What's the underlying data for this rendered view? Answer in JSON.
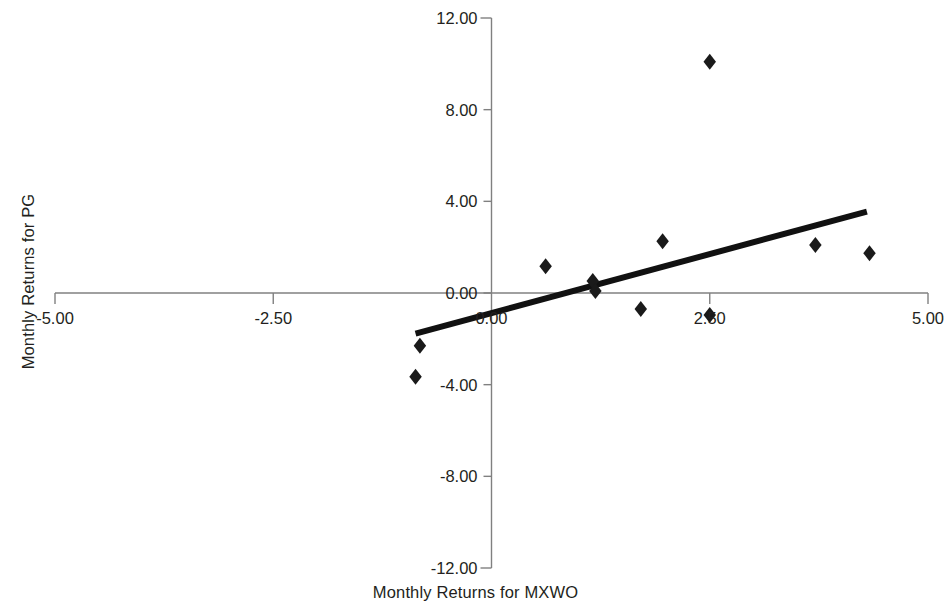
{
  "chart_data": {
    "type": "scatter",
    "title": "",
    "xlabel": "Monthly Returns for MXWO",
    "ylabel": "Monthly Returns for PG",
    "xlim": [
      -5.0,
      5.0
    ],
    "ylim": [
      -12.0,
      12.0
    ],
    "xticks": [
      -5.0,
      -2.5,
      0.0,
      2.5,
      5.0
    ],
    "yticks": [
      12.0,
      8.0,
      4.0,
      0.0,
      -4.0,
      -8.0,
      -12.0
    ],
    "xtick_labels": [
      "-5.00",
      "-2.50",
      "0.00",
      "2.50",
      "5.00"
    ],
    "ytick_labels": [
      "12.00",
      "8.00",
      "4.00",
      "0.00",
      "-4.00",
      "-8.00",
      "-12.00"
    ],
    "grid": false,
    "legend": null,
    "marker": "diamond",
    "marker_color": "#1a1a1a",
    "axis_color": "#808080",
    "trendline_color": "#111111",
    "points": [
      {
        "x": -0.87,
        "y": -3.65
      },
      {
        "x": -0.82,
        "y": -2.3
      },
      {
        "x": 0.62,
        "y": 1.17
      },
      {
        "x": 1.16,
        "y": 0.52
      },
      {
        "x": 1.19,
        "y": 0.09
      },
      {
        "x": 1.71,
        "y": -0.7
      },
      {
        "x": 1.96,
        "y": 2.26
      },
      {
        "x": 2.5,
        "y": 10.09
      },
      {
        "x": 2.5,
        "y": -0.96
      },
      {
        "x": 3.71,
        "y": 2.09
      },
      {
        "x": 4.33,
        "y": 1.74
      }
    ],
    "trendline": {
      "x_start": -0.87,
      "y_start": -1.77,
      "x_end": 4.3,
      "y_end": 3.55,
      "visible": true
    }
  }
}
